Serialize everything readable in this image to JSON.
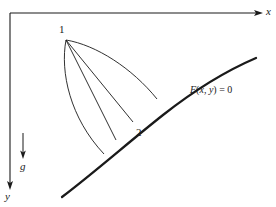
{
  "figure": {
    "type": "line-diagram",
    "background_color": "#ffffff",
    "line_color": "#1a1a1a",
    "axes": {
      "x_label": "x",
      "y_label": "y",
      "origin": {
        "x": 10,
        "y": 13
      },
      "x_axis_end": {
        "x": 262,
        "y": 13
      },
      "y_axis_end": {
        "x": 10,
        "y": 188
      },
      "x_label_pos": {
        "x": 266,
        "y": 7
      },
      "y_label_pos": {
        "x": 5,
        "y": 192
      }
    },
    "gravity": {
      "label": "g",
      "arrow_x": 23,
      "arrow_top_y": 133,
      "arrow_bottom_y": 158,
      "label_pos": {
        "x": 20,
        "y": 162
      }
    },
    "points": [
      {
        "id": "1",
        "label": "1",
        "x": 66,
        "y": 40,
        "label_pos": {
          "x": 59,
          "y": 25
        }
      },
      {
        "id": "2",
        "label": "2",
        "x": 133,
        "y": 122,
        "label_pos": {
          "x": 136,
          "y": 128
        }
      }
    ],
    "terminal_curve": {
      "label": "F(x, y) = 0",
      "label_italic_part_1": "F",
      "label_paren_open": "(",
      "label_var_x": "x",
      "label_comma": ", ",
      "label_var_y": "y",
      "label_paren_close": ")",
      "label_equals": " = 0",
      "label_pos": {
        "x": 190,
        "y": 90
      },
      "start": {
        "x": 62,
        "y": 197
      },
      "end": {
        "x": 256,
        "y": 58
      },
      "stroke_width": 2.2
    },
    "paths": [
      {
        "name": "path-curved-left",
        "curved": true,
        "end": {
          "x": 104,
          "y": 154
        }
      },
      {
        "name": "path-straight-outer-left",
        "curved": false,
        "end": {
          "x": 116,
          "y": 140
        }
      },
      {
        "name": "path-straight-middle",
        "curved": false,
        "end": {
          "x": 133,
          "y": 122
        }
      },
      {
        "name": "path-curved-right",
        "curved": true,
        "end": {
          "x": 157,
          "y": 99
        }
      }
    ]
  }
}
